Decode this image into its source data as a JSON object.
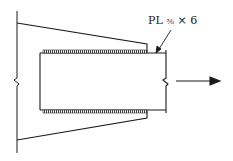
{
  "diagram": {
    "type": "structural-connection-detail",
    "label": {
      "prefix": "PL",
      "thickness": "3/8",
      "thickness_display": "⅜",
      "times": "×",
      "width": "6",
      "full_text": "PL ⅜ × 6"
    },
    "elements": {
      "gusset_plate": "tapered gusset with break line at left",
      "member": "rectangular member with break line at right",
      "welds": [
        "top longitudinal fillet weld",
        "bottom longitudinal fillet weld"
      ],
      "force_arrow": "tension pointing right"
    },
    "colors": {
      "line": "#1a1a1a",
      "background": "#ffffff",
      "weld": "#555555"
    }
  }
}
